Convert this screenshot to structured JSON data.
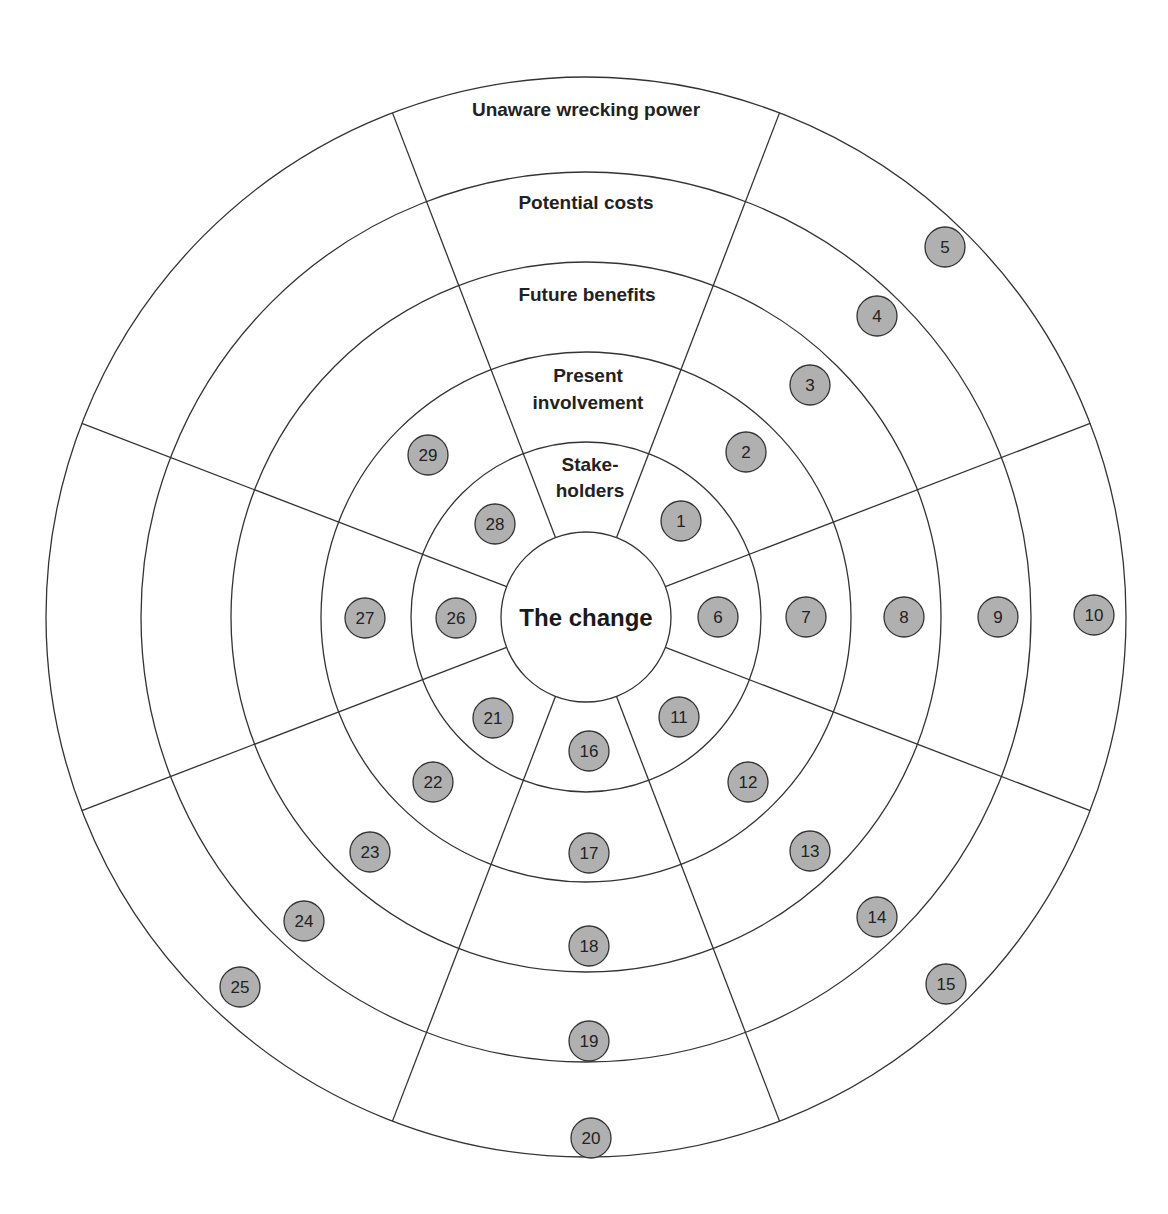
{
  "diagram": {
    "center_label": "The change",
    "ring_labels": [
      {
        "lines": [
          "Stake-",
          "holders"
        ]
      },
      {
        "lines": [
          "Present",
          "involvement"
        ]
      },
      {
        "lines": [
          "Future benefits"
        ]
      },
      {
        "lines": [
          "Potential costs"
        ]
      },
      {
        "lines": [
          "Unaware wrecking power"
        ]
      }
    ],
    "colors": {
      "node_fill": "#b0b0b0",
      "line": "#333333",
      "background": "#ffffff"
    },
    "nodes": [
      {
        "id": "1",
        "x": 681,
        "y": 521
      },
      {
        "id": "2",
        "x": 746,
        "y": 452
      },
      {
        "id": "3",
        "x": 810,
        "y": 385
      },
      {
        "id": "4",
        "x": 877,
        "y": 316
      },
      {
        "id": "5",
        "x": 945,
        "y": 247
      },
      {
        "id": "6",
        "x": 718,
        "y": 617
      },
      {
        "id": "7",
        "x": 806,
        "y": 617
      },
      {
        "id": "8",
        "x": 904,
        "y": 617
      },
      {
        "id": "9",
        "x": 998,
        "y": 617
      },
      {
        "id": "10",
        "x": 1094,
        "y": 615
      },
      {
        "id": "11",
        "x": 679,
        "y": 717
      },
      {
        "id": "12",
        "x": 748,
        "y": 782
      },
      {
        "id": "13",
        "x": 810,
        "y": 851
      },
      {
        "id": "14",
        "x": 877,
        "y": 917
      },
      {
        "id": "15",
        "x": 946,
        "y": 984
      },
      {
        "id": "16",
        "x": 589,
        "y": 751
      },
      {
        "id": "17",
        "x": 589,
        "y": 853
      },
      {
        "id": "18",
        "x": 589,
        "y": 946
      },
      {
        "id": "19",
        "x": 589,
        "y": 1041
      },
      {
        "id": "20",
        "x": 591,
        "y": 1138
      },
      {
        "id": "21",
        "x": 493,
        "y": 718
      },
      {
        "id": "22",
        "x": 433,
        "y": 782
      },
      {
        "id": "23",
        "x": 370,
        "y": 852
      },
      {
        "id": "24",
        "x": 304,
        "y": 921
      },
      {
        "id": "25",
        "x": 240,
        "y": 987
      },
      {
        "id": "26",
        "x": 456,
        "y": 618
      },
      {
        "id": "27",
        "x": 365,
        "y": 618
      },
      {
        "id": "28",
        "x": 495,
        "y": 524
      },
      {
        "id": "29",
        "x": 428,
        "y": 455
      }
    ]
  }
}
